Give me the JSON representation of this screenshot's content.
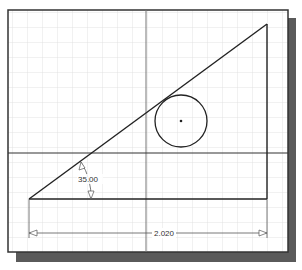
{
  "sketch": {
    "title": "",
    "grid_color": "#dcdcdc",
    "axis_color": "#555555",
    "line_color": "#222222",
    "shadow_color": "#5a5a5a",
    "frame_color": "#333333"
  },
  "dimensions": {
    "angle_label": "35.00",
    "length_label": "2.020"
  },
  "geometry": {
    "triangle": {
      "bottom_left": [
        29,
        199
      ],
      "top_right": [
        267,
        24
      ],
      "bottom_right": [
        267,
        199
      ]
    },
    "circle": {
      "center": [
        181,
        121
      ],
      "radius": 26
    },
    "axes": {
      "vertical_x": 146,
      "horizontal_y": 153
    }
  }
}
